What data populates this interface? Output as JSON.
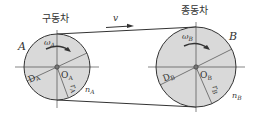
{
  "diagram": {
    "belt": {
      "velocity_label": "v"
    },
    "pulley_a": {
      "caption": "구동차",
      "name": "A",
      "omega": "ω",
      "omega_sub": "A",
      "diameter": "D",
      "diameter_sub": "A",
      "center": "O",
      "center_sub": "A",
      "radius": "r",
      "radius_sub": "A",
      "rpm": "n",
      "rpm_sub": "A"
    },
    "pulley_b": {
      "caption": "종동차",
      "name": "B",
      "omega": "ω",
      "omega_sub": "B",
      "diameter": "D",
      "diameter_sub": "B",
      "center": "O",
      "center_sub": "B",
      "radius": "r",
      "radius_sub": "B",
      "rpm": "n",
      "rpm_sub": "B"
    },
    "colors": {
      "pulley_fill": "#d9d9d9",
      "line": "#333333"
    }
  }
}
